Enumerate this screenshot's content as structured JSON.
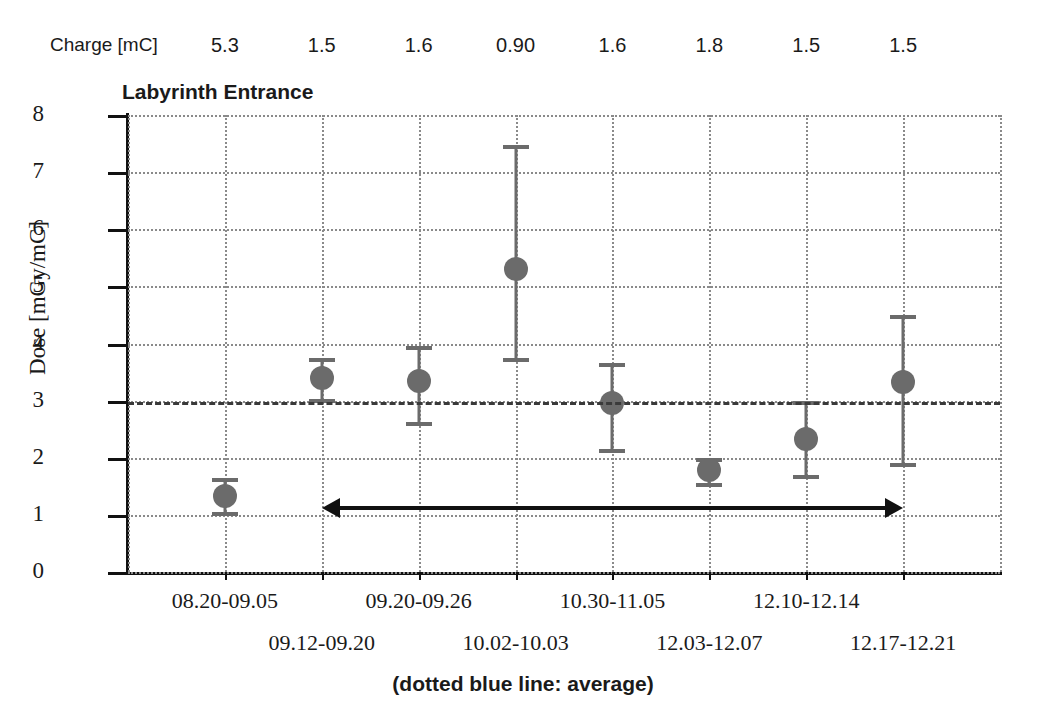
{
  "chart_data": {
    "type": "scatter",
    "title": "Labyrinth Entrance",
    "xlabel": "",
    "ylabel": "Dose [mGy/mC]",
    "ylim": [
      0,
      8
    ],
    "yticks": [
      "0",
      "1",
      "2",
      "3",
      "4",
      "5",
      "6",
      "7",
      "8"
    ],
    "grid": true,
    "legend_position": "none",
    "categories": [
      "08.20-09.05",
      "09.12-09.20",
      "09.20-09.26",
      "10.02-10.03",
      "10.30-11.05",
      "12.03-12.07",
      "12.10-12.14",
      "12.17-12.21"
    ],
    "values": [
      1.33,
      3.4,
      3.35,
      5.3,
      2.95,
      1.78,
      2.32,
      3.33
    ],
    "err_low": [
      1.05,
      3.02,
      2.63,
      3.75,
      2.15,
      1.55,
      1.7,
      1.9
    ],
    "err_high": [
      1.65,
      3.75,
      3.95,
      7.47,
      3.65,
      2.0,
      3.0,
      4.5
    ],
    "average": 2.97,
    "annotations": {
      "charge_row_label": "Charge [mC]",
      "charge_values": [
        "5.3",
        "1.5",
        "1.6",
        "0.90",
        "1.6",
        "1.8",
        "1.5",
        "1.5"
      ],
      "footnote": "(dotted blue line: average)",
      "span_arrow": {
        "from_category": "09.12-09.20",
        "to_category": "12.17-12.21",
        "y": 1.12,
        "style": "double-headed"
      }
    },
    "colors": {
      "marker": "#6b6b6b",
      "errorbar": "#6b6b6b",
      "average_line": "#3a3a3a",
      "grid": "#8a8a8a",
      "axis": "#111111",
      "text": "#1a1a1a"
    }
  }
}
